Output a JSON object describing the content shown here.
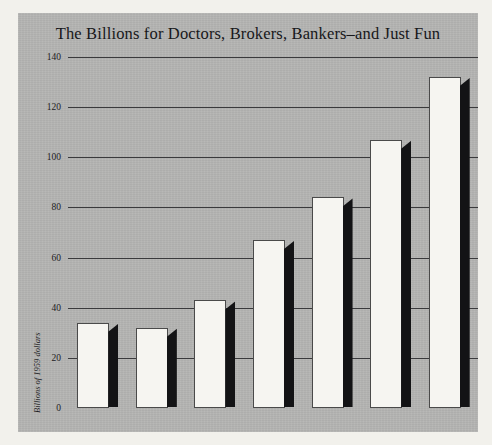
{
  "chart_data": {
    "type": "bar",
    "title": "The Billions for Doctors, Brokers, Bankers–and Just Fun",
    "xlabel": "",
    "ylabel": "Billions of 1959 dollars",
    "categories": [
      "1929",
      "1940",
      "1947",
      "1953",
      "1959",
      "1965",
      "1970"
    ],
    "category_suffixes": [
      "",
      "",
      "",
      "",
      "est.",
      "proj.",
      "proj."
    ],
    "values": [
      34,
      32,
      43,
      67,
      84,
      107,
      132
    ],
    "ylim": [
      0,
      140
    ],
    "yticks": [
      0,
      20,
      40,
      60,
      80,
      100,
      120,
      140
    ],
    "ytick_labels": [
      "0",
      "20",
      "40",
      "60",
      "80",
      "100",
      "120",
      "140"
    ],
    "grid": true,
    "legend": false,
    "style": {
      "panel_background": "#b4b4b2",
      "figure_background": "#f2f1ec",
      "bar_face": "#f6f5f1",
      "bar_side": "#131315",
      "gridline": "#3a3a3c",
      "axis": "#111113",
      "text": "#1c1c1e"
    }
  }
}
